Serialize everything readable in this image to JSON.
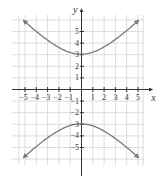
{
  "chart_data": {
    "type": "line",
    "title": "",
    "xlabel": "x",
    "ylabel": "y",
    "xlim": [
      -5.5,
      5.5
    ],
    "ylim": [
      -6.5,
      6.5
    ],
    "grid": true,
    "x_ticks": [
      -5,
      -4,
      -3,
      -2,
      -1,
      1,
      2,
      3,
      4,
      5
    ],
    "y_ticks": [
      -5,
      -4,
      -3,
      -2,
      -1,
      1,
      2,
      3,
      4,
      5
    ],
    "x_tick_labels": [
      "−5",
      "−4",
      "−3",
      "−2",
      "−1",
      "1",
      "2",
      "3",
      "4",
      "5"
    ],
    "y_tick_labels": [
      "−5",
      "−4",
      "−3",
      "−2",
      "−1",
      "1",
      "2",
      "3",
      "4",
      "5"
    ],
    "series": [
      {
        "name": "upper branch",
        "equation": "y = sqrt(9 + x^2)",
        "x": [
          -5,
          -4,
          -3,
          -2,
          -1,
          0,
          1,
          2,
          3,
          4,
          5
        ],
        "y": [
          5.83,
          5.0,
          4.24,
          3.61,
          3.16,
          3.0,
          3.16,
          3.61,
          4.24,
          5.0,
          5.83
        ]
      },
      {
        "name": "lower branch",
        "equation": "y = -sqrt(9 + x^2)",
        "x": [
          -5,
          -4,
          -3,
          -2,
          -1,
          0,
          1,
          2,
          3,
          4,
          5
        ],
        "y": [
          -5.83,
          -5.0,
          -4.24,
          -3.61,
          -3.16,
          -3.0,
          -3.16,
          -3.61,
          -4.24,
          -5.0,
          -5.83
        ]
      }
    ],
    "colors": {
      "curve": "#7a7a7a",
      "axis": "#333333",
      "grid": "#dcdcdc"
    }
  }
}
